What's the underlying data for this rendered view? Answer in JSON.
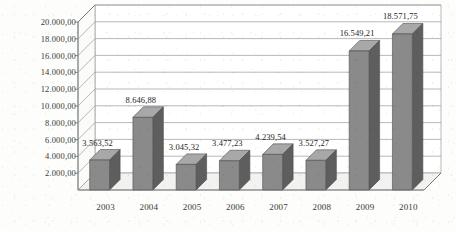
{
  "chart_data": {
    "type": "bar",
    "title": "",
    "subtitle": "",
    "xlabel": "",
    "ylabel": "",
    "categories": [
      "2003",
      "2004",
      "2005",
      "2006",
      "2007",
      "2008",
      "2009",
      "2010"
    ],
    "values": [
      3563.52,
      8646.88,
      3045.32,
      3477.23,
      4239.54,
      3527.27,
      16549.21,
      18571.75
    ],
    "data_labels": [
      "3.563,52",
      "8.646,88",
      "3.045,32",
      "3.477,23",
      "4.239,54",
      "3.527,27",
      "16.549,21",
      "18.571,75"
    ],
    "ylim": [
      0,
      20000
    ],
    "ytick_values": [
      2000,
      4000,
      6000,
      8000,
      10000,
      12000,
      14000,
      16000,
      18000,
      20000
    ],
    "ytick_labels": [
      "2.000,00",
      "4.000,00",
      "6.000,00",
      "8.000,00",
      "10.000,00",
      "12.000,00",
      "14.000,00",
      "16.000,00",
      "18.000,00",
      "20.000,00"
    ],
    "grid": true,
    "legend": null,
    "legend_position": "none",
    "style": "3d-column",
    "number_format": "european",
    "series": [
      {
        "name": "",
        "values": [
          3563.52,
          8646.88,
          3045.32,
          3477.23,
          4239.54,
          3527.27,
          16549.21,
          18571.75
        ]
      }
    ]
  },
  "colors": {
    "bar_front": "#8a8a8a",
    "bar_side": "#5e5e5e",
    "bar_top": "#a8a8a8",
    "wall": "#ffffff",
    "floor": "#f2f2f0",
    "grid": "#9b9b9b",
    "axis": "#6f6f6f",
    "text": "#2b2b2b",
    "background": "#fdfdfc"
  }
}
